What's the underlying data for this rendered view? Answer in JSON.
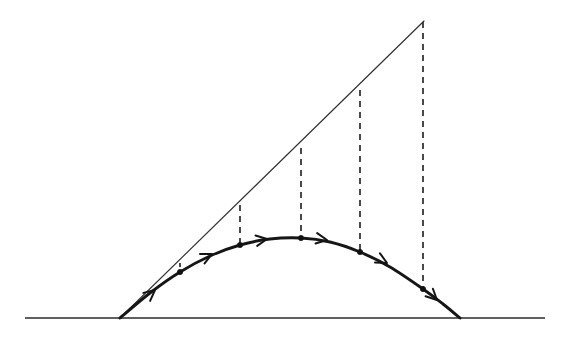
{
  "figure": {
    "kind": "projectile-motion-parabola-diagram",
    "canvas": {
      "width": 571,
      "height": 341
    },
    "background_color": "#ffffff",
    "ink_color": "#161616"
  },
  "chart_data": {
    "type": "line",
    "title": "",
    "subtitle": "",
    "xlabel": "",
    "ylabel": "",
    "grid": false,
    "legend_position": "none",
    "xlim": [
      0,
      571
    ],
    "ylim": [
      341,
      0
    ],
    "annotations": [],
    "tick_labels": {
      "x": [],
      "y": []
    },
    "series": [
      {
        "name": "ground-line",
        "style": "solid",
        "color": "#2b2b2b",
        "points": [
          [
            25,
            318
          ],
          [
            545,
            318
          ]
        ]
      },
      {
        "name": "inertial-straight-line",
        "style": "solid",
        "color": "#2e2e2e",
        "points": [
          [
            120,
            318
          ],
          [
            424,
            21
          ]
        ]
      },
      {
        "name": "parabolic-trajectory",
        "style": "solid",
        "color": "#161616",
        "points": [
          [
            120,
            318
          ],
          [
            150,
            293
          ],
          [
            180,
            272
          ],
          [
            210,
            256
          ],
          [
            240,
            245
          ],
          [
            270,
            239
          ],
          [
            301,
            238
          ],
          [
            330,
            242
          ],
          [
            360,
            252
          ],
          [
            390,
            267
          ],
          [
            423,
            289
          ],
          [
            443,
            304
          ],
          [
            460,
            318
          ]
        ]
      }
    ],
    "fall_segments": [
      {
        "name": "drop-1",
        "x": 180,
        "y_line": 263,
        "y_curve": 272,
        "length": 9
      },
      {
        "name": "drop-2",
        "x": 240,
        "y_line": 205,
        "y_curve": 245,
        "length": 40
      },
      {
        "name": "drop-3",
        "x": 301,
        "y_line": 148,
        "y_curve": 238,
        "length": 90
      },
      {
        "name": "drop-4",
        "x": 360,
        "y_line": 90,
        "y_curve": 252,
        "length": 162
      },
      {
        "name": "drop-5",
        "x": 423,
        "y_line": 22,
        "y_curve": 289,
        "length": 267
      }
    ],
    "trajectory_markers": [
      {
        "name": "marker-1",
        "x": 180,
        "y": 272
      },
      {
        "name": "marker-2",
        "x": 240,
        "y": 245
      },
      {
        "name": "marker-3",
        "x": 301,
        "y": 238
      },
      {
        "name": "marker-4",
        "x": 360,
        "y": 252
      },
      {
        "name": "marker-5",
        "x": 423,
        "y": 289
      }
    ],
    "direction_arrows": [
      {
        "name": "arrow-1",
        "x": 155,
        "y": 290,
        "angle": -40
      },
      {
        "name": "arrow-2",
        "x": 212,
        "y": 254,
        "angle": -26
      },
      {
        "name": "arrow-3",
        "x": 267,
        "y": 239,
        "angle": -9
      },
      {
        "name": "arrow-4",
        "x": 327,
        "y": 240,
        "angle": 9
      },
      {
        "name": "arrow-5",
        "x": 387,
        "y": 263,
        "angle": 28
      },
      {
        "name": "arrow-6",
        "x": 437,
        "y": 300,
        "angle": 44
      }
    ],
    "key_points": {
      "launch_point": [
        120,
        318
      ],
      "apex_of_straight_line": [
        424,
        21
      ],
      "parabola_vertex": [
        301,
        238
      ],
      "landing_point": [
        460,
        318
      ],
      "ground_y": 318
    }
  }
}
